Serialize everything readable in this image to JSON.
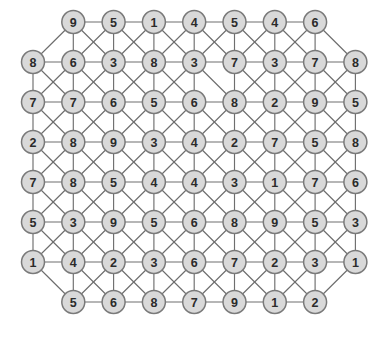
{
  "figure": {
    "title": "",
    "type": "graph-node-grid",
    "background_color": "#ffffff",
    "node_fill_color": "#d9d9d9",
    "node_stroke_color": "#7a7a7a",
    "edge_color": "#6e6e6e",
    "label_color": "#2b2b2b"
  },
  "layout": {
    "origin_x": 33,
    "origin_y": 22,
    "col_spacing": 40.3,
    "row_spacing": 40.0,
    "node_radius": 11.5,
    "rows": 8,
    "full_row_columns": 9,
    "short_row_columns": 7,
    "short_row_offset_columns": 1
  },
  "graph": {
    "node_count": 70,
    "rows": [
      {
        "row_index": 0,
        "indented": true,
        "labels": [
          "9",
          "5",
          "1",
          "4",
          "5",
          "4",
          "6"
        ]
      },
      {
        "row_index": 1,
        "indented": false,
        "labels": [
          "8",
          "6",
          "3",
          "8",
          "3",
          "7",
          "3",
          "7",
          "8"
        ]
      },
      {
        "row_index": 2,
        "indented": false,
        "labels": [
          "7",
          "7",
          "6",
          "5",
          "6",
          "8",
          "2",
          "9",
          "5"
        ]
      },
      {
        "row_index": 3,
        "indented": false,
        "labels": [
          "2",
          "8",
          "9",
          "3",
          "4",
          "2",
          "7",
          "5",
          "8"
        ]
      },
      {
        "row_index": 4,
        "indented": false,
        "labels": [
          "7",
          "8",
          "5",
          "4",
          "4",
          "3",
          "1",
          "7",
          "6"
        ]
      },
      {
        "row_index": 5,
        "indented": false,
        "labels": [
          "5",
          "3",
          "9",
          "5",
          "6",
          "8",
          "9",
          "5",
          "3"
        ]
      },
      {
        "row_index": 6,
        "indented": false,
        "labels": [
          "1",
          "4",
          "2",
          "3",
          "6",
          "7",
          "2",
          "3",
          "1"
        ]
      },
      {
        "row_index": 7,
        "indented": true,
        "labels": [
          "5",
          "6",
          "8",
          "7",
          "9",
          "1",
          "2"
        ]
      }
    ],
    "edges": [
      [
        0,
        0,
        0,
        1
      ],
      [
        0,
        1,
        0,
        2
      ],
      [
        0,
        2,
        0,
        3
      ],
      [
        0,
        3,
        0,
        4
      ],
      [
        0,
        4,
        0,
        5
      ],
      [
        0,
        5,
        0,
        6
      ],
      [
        1,
        0,
        1,
        1
      ],
      [
        1,
        1,
        1,
        2
      ],
      [
        1,
        2,
        1,
        3
      ],
      [
        1,
        3,
        1,
        4
      ],
      [
        1,
        4,
        1,
        5
      ],
      [
        1,
        5,
        1,
        6
      ],
      [
        1,
        6,
        1,
        7
      ],
      [
        1,
        7,
        1,
        8
      ],
      [
        2,
        0,
        2,
        1
      ],
      [
        2,
        1,
        2,
        2
      ],
      [
        2,
        2,
        2,
        3
      ],
      [
        2,
        3,
        2,
        4
      ],
      [
        2,
        4,
        2,
        5
      ],
      [
        2,
        5,
        2,
        6
      ],
      [
        2,
        6,
        2,
        7
      ],
      [
        2,
        7,
        2,
        8
      ],
      [
        3,
        0,
        3,
        1
      ],
      [
        3,
        1,
        3,
        2
      ],
      [
        3,
        2,
        3,
        3
      ],
      [
        3,
        3,
        3,
        4
      ],
      [
        3,
        4,
        3,
        5
      ],
      [
        3,
        5,
        3,
        6
      ],
      [
        3,
        6,
        3,
        7
      ],
      [
        3,
        7,
        3,
        8
      ],
      [
        4,
        0,
        4,
        1
      ],
      [
        4,
        1,
        4,
        2
      ],
      [
        4,
        2,
        4,
        3
      ],
      [
        4,
        3,
        4,
        4
      ],
      [
        4,
        4,
        4,
        5
      ],
      [
        4,
        5,
        4,
        6
      ],
      [
        4,
        6,
        4,
        7
      ],
      [
        4,
        7,
        4,
        8
      ],
      [
        5,
        0,
        5,
        1
      ],
      [
        5,
        1,
        5,
        2
      ],
      [
        5,
        2,
        5,
        3
      ],
      [
        5,
        3,
        5,
        4
      ],
      [
        5,
        4,
        5,
        5
      ],
      [
        5,
        5,
        5,
        6
      ],
      [
        5,
        6,
        5,
        7
      ],
      [
        5,
        7,
        5,
        8
      ],
      [
        6,
        0,
        6,
        1
      ],
      [
        6,
        1,
        6,
        2
      ],
      [
        6,
        2,
        6,
        3
      ],
      [
        6,
        3,
        6,
        4
      ],
      [
        6,
        4,
        6,
        5
      ],
      [
        6,
        5,
        6,
        6
      ],
      [
        6,
        6,
        6,
        7
      ],
      [
        6,
        7,
        6,
        8
      ],
      [
        7,
        0,
        7,
        1
      ],
      [
        7,
        1,
        7,
        2
      ],
      [
        7,
        2,
        7,
        3
      ],
      [
        7,
        3,
        7,
        4
      ],
      [
        7,
        4,
        7,
        5
      ],
      [
        7,
        5,
        7,
        6
      ],
      [
        0,
        0,
        1,
        1
      ],
      [
        0,
        1,
        1,
        2
      ],
      [
        0,
        2,
        1,
        3
      ],
      [
        0,
        3,
        1,
        4
      ],
      [
        0,
        4,
        1,
        5
      ],
      [
        0,
        5,
        1,
        6
      ],
      [
        0,
        6,
        1,
        7
      ],
      [
        1,
        0,
        2,
        0
      ],
      [
        1,
        1,
        2,
        1
      ],
      [
        1,
        2,
        2,
        2
      ],
      [
        1,
        3,
        2,
        3
      ],
      [
        1,
        4,
        2,
        4
      ],
      [
        1,
        5,
        2,
        5
      ],
      [
        1,
        6,
        2,
        6
      ],
      [
        1,
        7,
        2,
        7
      ],
      [
        1,
        8,
        2,
        8
      ],
      [
        2,
        0,
        3,
        0
      ],
      [
        2,
        1,
        3,
        1
      ],
      [
        2,
        2,
        3,
        2
      ],
      [
        2,
        3,
        3,
        3
      ],
      [
        2,
        4,
        3,
        4
      ],
      [
        2,
        5,
        3,
        5
      ],
      [
        2,
        6,
        3,
        6
      ],
      [
        2,
        7,
        3,
        7
      ],
      [
        2,
        8,
        3,
        8
      ],
      [
        3,
        0,
        4,
        0
      ],
      [
        3,
        1,
        4,
        1
      ],
      [
        3,
        2,
        4,
        2
      ],
      [
        3,
        3,
        4,
        3
      ],
      [
        3,
        4,
        4,
        4
      ],
      [
        3,
        5,
        4,
        5
      ],
      [
        3,
        6,
        4,
        6
      ],
      [
        3,
        7,
        4,
        7
      ],
      [
        3,
        8,
        4,
        8
      ],
      [
        4,
        0,
        5,
        0
      ],
      [
        4,
        1,
        5,
        1
      ],
      [
        4,
        2,
        5,
        2
      ],
      [
        4,
        3,
        5,
        3
      ],
      [
        4,
        4,
        5,
        4
      ],
      [
        4,
        5,
        5,
        5
      ],
      [
        4,
        6,
        5,
        6
      ],
      [
        4,
        7,
        5,
        7
      ],
      [
        4,
        8,
        5,
        8
      ],
      [
        5,
        0,
        6,
        0
      ],
      [
        5,
        1,
        6,
        1
      ],
      [
        5,
        2,
        6,
        2
      ],
      [
        5,
        3,
        6,
        3
      ],
      [
        5,
        4,
        6,
        4
      ],
      [
        5,
        5,
        6,
        5
      ],
      [
        5,
        6,
        6,
        6
      ],
      [
        5,
        7,
        6,
        7
      ],
      [
        5,
        8,
        6,
        8
      ],
      [
        6,
        1,
        7,
        0
      ],
      [
        6,
        2,
        7,
        1
      ],
      [
        6,
        3,
        7,
        2
      ],
      [
        6,
        4,
        7,
        3
      ],
      [
        6,
        5,
        7,
        4
      ],
      [
        6,
        6,
        7,
        5
      ],
      [
        6,
        7,
        7,
        6
      ],
      [
        0,
        0,
        1,
        0
      ],
      [
        0,
        0,
        1,
        2
      ],
      [
        0,
        1,
        1,
        1
      ],
      [
        0,
        1,
        1,
        3
      ],
      [
        0,
        2,
        1,
        2
      ],
      [
        0,
        2,
        1,
        4
      ],
      [
        0,
        3,
        1,
        3
      ],
      [
        0,
        3,
        1,
        5
      ],
      [
        0,
        4,
        1,
        4
      ],
      [
        0,
        4,
        1,
        6
      ],
      [
        0,
        5,
        1,
        5
      ],
      [
        0,
        5,
        1,
        7
      ],
      [
        0,
        6,
        1,
        6
      ],
      [
        0,
        6,
        1,
        8
      ],
      [
        1,
        0,
        2,
        1
      ],
      [
        1,
        1,
        2,
        0
      ],
      [
        1,
        1,
        2,
        2
      ],
      [
        1,
        2,
        2,
        1
      ],
      [
        1,
        2,
        2,
        3
      ],
      [
        1,
        3,
        2,
        2
      ],
      [
        1,
        3,
        2,
        4
      ],
      [
        1,
        4,
        2,
        3
      ],
      [
        1,
        4,
        2,
        5
      ],
      [
        1,
        5,
        2,
        6
      ],
      [
        1,
        6,
        2,
        5
      ],
      [
        1,
        6,
        2,
        7
      ],
      [
        1,
        7,
        2,
        6
      ],
      [
        1,
        7,
        2,
        8
      ],
      [
        1,
        8,
        2,
        7
      ],
      [
        2,
        0,
        3,
        1
      ],
      [
        2,
        1,
        3,
        0
      ],
      [
        2,
        1,
        3,
        2
      ],
      [
        2,
        2,
        3,
        1
      ],
      [
        2,
        2,
        3,
        3
      ],
      [
        2,
        3,
        3,
        2
      ],
      [
        2,
        3,
        3,
        4
      ],
      [
        2,
        4,
        3,
        3
      ],
      [
        2,
        4,
        3,
        5
      ],
      [
        2,
        5,
        3,
        4
      ],
      [
        2,
        5,
        3,
        6
      ],
      [
        2,
        6,
        3,
        5
      ],
      [
        2,
        6,
        3,
        7
      ],
      [
        2,
        7,
        3,
        6
      ],
      [
        2,
        7,
        3,
        8
      ],
      [
        2,
        8,
        3,
        7
      ],
      [
        3,
        0,
        4,
        1
      ],
      [
        3,
        1,
        4,
        0
      ],
      [
        3,
        1,
        4,
        2
      ],
      [
        3,
        2,
        4,
        1
      ],
      [
        3,
        2,
        4,
        3
      ],
      [
        3,
        3,
        4,
        2
      ],
      [
        3,
        3,
        4,
        4
      ],
      [
        3,
        4,
        4,
        3
      ],
      [
        3,
        4,
        4,
        5
      ],
      [
        3,
        5,
        4,
        4
      ],
      [
        3,
        5,
        4,
        6
      ],
      [
        3,
        6,
        4,
        5
      ],
      [
        3,
        6,
        4,
        7
      ],
      [
        3,
        7,
        4,
        6
      ],
      [
        3,
        7,
        4,
        8
      ],
      [
        3,
        8,
        4,
        7
      ],
      [
        4,
        0,
        5,
        1
      ],
      [
        4,
        1,
        5,
        0
      ],
      [
        4,
        1,
        5,
        2
      ],
      [
        4,
        2,
        5,
        1
      ],
      [
        4,
        2,
        5,
        3
      ],
      [
        4,
        3,
        5,
        2
      ],
      [
        4,
        3,
        5,
        4
      ],
      [
        4,
        4,
        5,
        3
      ],
      [
        4,
        4,
        5,
        5
      ],
      [
        4,
        5,
        5,
        4
      ],
      [
        4,
        5,
        5,
        6
      ],
      [
        4,
        6,
        5,
        5
      ],
      [
        4,
        6,
        5,
        7
      ],
      [
        4,
        7,
        5,
        6
      ],
      [
        4,
        7,
        5,
        8
      ],
      [
        4,
        8,
        5,
        7
      ],
      [
        5,
        0,
        6,
        1
      ],
      [
        5,
        1,
        6,
        0
      ],
      [
        5,
        1,
        6,
        2
      ],
      [
        5,
        2,
        6,
        1
      ],
      [
        5,
        2,
        6,
        3
      ],
      [
        5,
        3,
        6,
        2
      ],
      [
        5,
        3,
        6,
        4
      ],
      [
        5,
        4,
        6,
        3
      ],
      [
        5,
        4,
        6,
        5
      ],
      [
        5,
        5,
        6,
        4
      ],
      [
        5,
        5,
        6,
        6
      ],
      [
        5,
        6,
        6,
        5
      ],
      [
        5,
        6,
        6,
        7
      ],
      [
        5,
        7,
        6,
        6
      ],
      [
        5,
        7,
        6,
        8
      ],
      [
        5,
        8,
        6,
        7
      ],
      [
        6,
        0,
        7,
        0
      ],
      [
        6,
        1,
        7,
        1
      ],
      [
        6,
        2,
        7,
        0
      ],
      [
        6,
        2,
        7,
        2
      ],
      [
        6,
        3,
        7,
        1
      ],
      [
        6,
        3,
        7,
        3
      ],
      [
        6,
        4,
        7,
        2
      ],
      [
        6,
        4,
        7,
        4
      ],
      [
        6,
        5,
        7,
        3
      ],
      [
        6,
        5,
        7,
        5
      ],
      [
        6,
        6,
        7,
        4
      ],
      [
        6,
        6,
        7,
        6
      ],
      [
        6,
        7,
        7,
        5
      ],
      [
        6,
        8,
        7,
        6
      ]
    ]
  }
}
